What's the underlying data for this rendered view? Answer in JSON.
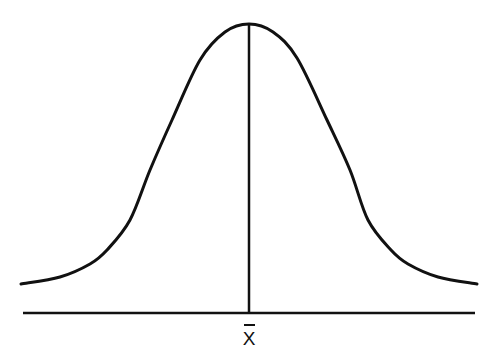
{
  "diagram": {
    "type": "normal-distribution",
    "colors": {
      "stroke": "#111111",
      "background": "#ffffff"
    },
    "mean_label": "X",
    "mean_label_has_overbar": true,
    "curve_points_left": [
      [
        21,
        284
      ],
      [
        60,
        277
      ],
      [
        90,
        264
      ],
      [
        107,
        250
      ],
      [
        130,
        220
      ],
      [
        150,
        170
      ],
      [
        172,
        120
      ],
      [
        200,
        60
      ],
      [
        225,
        32
      ],
      [
        249,
        24
      ]
    ],
    "curve_points_right": [
      [
        249,
        24
      ],
      [
        273,
        32
      ],
      [
        297,
        58
      ],
      [
        327,
        120
      ],
      [
        350,
        170
      ],
      [
        368,
        220
      ],
      [
        391,
        250
      ],
      [
        408,
        264
      ],
      [
        438,
        277
      ],
      [
        477,
        284
      ]
    ],
    "mean_line": {
      "x": 249,
      "y_top": 24,
      "y_bottom": 313
    },
    "baseline": {
      "y": 313,
      "x_start": 23,
      "x_end": 475
    }
  }
}
